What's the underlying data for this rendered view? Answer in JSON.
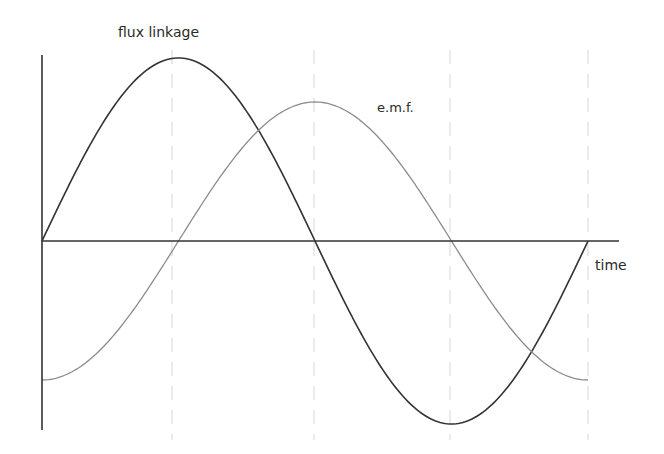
{
  "diagram": {
    "labels": {
      "flux": "flux linkage",
      "emf": "e.m.f.",
      "time": "time"
    },
    "colors": {
      "axes": "#333333",
      "flux_curve": "#333333",
      "emf_curve": "#8c8c8c",
      "guides": "#dcdcdc",
      "background": "#ffffff"
    },
    "geometry": {
      "origin_x": 42,
      "axis_y": 241,
      "y_axis_top": 55,
      "y_axis_bottom": 430,
      "x_axis_end": 619,
      "period_px": 546,
      "flux_amplitude_px": 183,
      "emf_amplitude_px": 139,
      "guide_xs": [
        172,
        314,
        450,
        588
      ],
      "guide_top": 50,
      "guide_bottom": 440
    }
  },
  "chart_data": {
    "type": "line",
    "title": "",
    "xlabel": "time",
    "ylabel": "",
    "x": [
      "0",
      "T/4",
      "T/2",
      "3T/4",
      "T"
    ],
    "series": [
      {
        "name": "flux linkage",
        "values": [
          0,
          1,
          0,
          -1,
          0
        ],
        "shape": "sine"
      },
      {
        "name": "e.m.f.",
        "values": [
          -0.76,
          0,
          0.76,
          0,
          -0.76
        ],
        "shape": "negative cosine (lags flux by 90°)"
      }
    ],
    "grid": "vertical dashed guides at quarter periods",
    "legend": "inline labels"
  }
}
